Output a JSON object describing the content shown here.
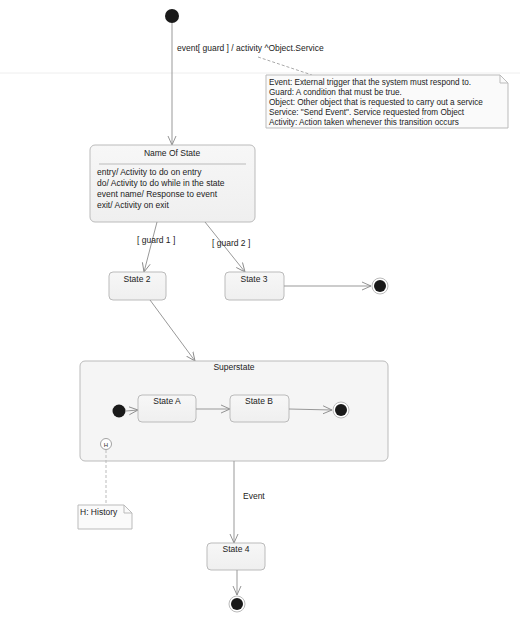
{
  "diagram": {
    "type": "UML State Machine",
    "transition_label": "event[ guard ] / activity ^Object.Service",
    "legend_note": {
      "lines": [
        "Event: External trigger that the system must respond to.",
        "Guard: A condition that must be true.",
        "Object: Other object that is requested to carry out a service",
        "Service: \"Send Event\". Service requested from Object",
        "Activity: Action taken whenever this transition occurs"
      ]
    },
    "main_state": {
      "name": "Name Of State",
      "activities": [
        "entry/ Activity to do on entry",
        "do/ Activity to do while in the state",
        "event name/ Response to event",
        "exit/ Activity on exit"
      ]
    },
    "guards": {
      "guard1": "[ guard 1 ]",
      "guard2": "[ guard 2 ]"
    },
    "states": {
      "state2": "State 2",
      "state3": "State 3",
      "state4": "State 4"
    },
    "superstate": {
      "name": "Superstate",
      "state_a": "State A",
      "state_b": "State B",
      "history_symbol": "H"
    },
    "history_note": "H: History",
    "event_label": "Event"
  }
}
